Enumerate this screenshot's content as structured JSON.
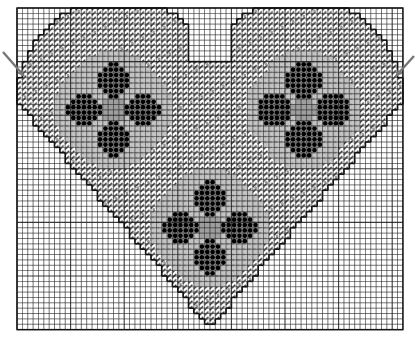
{
  "diagram": {
    "type": "needlepoint-chart",
    "grid": {
      "left": 17,
      "top": 8,
      "cols": 72,
      "rows": 60,
      "cell": 5.36,
      "line_color": "#1a1a1a",
      "bg": "#ffffff"
    },
    "heart": {
      "cx": 36,
      "notch_row": 10,
      "lobe_left_cx": 19,
      "lobe_right_cx": 53,
      "lobe_cy": 17,
      "lobe_r": 19,
      "tip_row": 59
    },
    "flowers": [
      {
        "name": "left-flower",
        "col": 18,
        "row": 19
      },
      {
        "name": "right-flower",
        "col": 53.5,
        "row": 19
      },
      {
        "name": "bottom-flower",
        "col": 36,
        "row": 41
      }
    ],
    "flower_radius": 11,
    "petal_radius": 3.2,
    "petal_offset": 5.5,
    "colors": {
      "stitch_dark": "#2a2a2a",
      "stitch_grey": "#b8b8b8",
      "petal": "#000000",
      "outline": "#111111",
      "arrow": "#777777"
    },
    "markers": [
      {
        "name": "left-center-arrow",
        "x1": 3,
        "y1": 52,
        "x2": 24,
        "y2": 76
      },
      {
        "name": "right-center-arrow",
        "x1": 414,
        "y1": 56,
        "x2": 396,
        "y2": 76
      }
    ]
  }
}
